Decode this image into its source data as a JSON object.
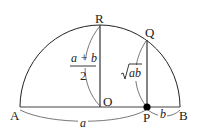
{
  "diagram": {
    "points": {
      "A": "A",
      "B": "B",
      "O": "O",
      "P": "P",
      "Q": "Q",
      "R": "R"
    },
    "labels": {
      "am_numerator": "a + b",
      "am_denominator": "2",
      "gm_radicand": "ab",
      "segment_a": "a",
      "segment_b": "b"
    },
    "colors": {
      "stroke": "#222222",
      "background": "#ffffff"
    }
  }
}
